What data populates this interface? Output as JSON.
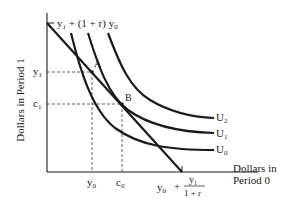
{
  "diagram": {
    "y_axis_label": "Dollars in Period 1",
    "x_axis_label_line1": "Dollars in",
    "x_axis_label_line2": "Period 0",
    "y_intercept_label": {
      "a": "y",
      "a_sub": "1",
      "mid": " + (1 + r) ",
      "b": "y",
      "b_sub": "0"
    },
    "x_intercept_label": {
      "a": "y",
      "a_sub": "0",
      "plus": "+",
      "num": "y",
      "num_sub": "1",
      "den": "1 + r"
    },
    "y_ticks": [
      {
        "name": "y",
        "sub": "1"
      },
      {
        "name": "c",
        "sub": "1"
      }
    ],
    "x_ticks": [
      {
        "name": "y",
        "sub": "0"
      },
      {
        "name": "c",
        "sub": "0"
      }
    ],
    "points": [
      {
        "label": "A"
      },
      {
        "label": "B"
      }
    ],
    "curves": [
      {
        "label": "U",
        "sub": "2"
      },
      {
        "label": "U",
        "sub": "1"
      },
      {
        "label": "U",
        "sub": "0"
      }
    ],
    "colors": {
      "ink": "#1a1a1a",
      "background": "#ffffff"
    }
  }
}
